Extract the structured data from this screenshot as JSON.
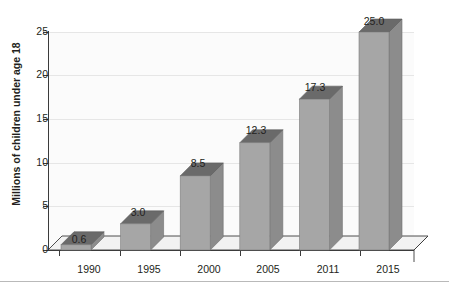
{
  "chart_data": {
    "type": "bar",
    "title": "",
    "title_clipped_note": "",
    "categories": [
      "1990",
      "1995",
      "2000",
      "2005",
      "2011",
      "2015"
    ],
    "values": [
      0.6,
      3.0,
      8.5,
      12.3,
      17.3,
      25.0
    ],
    "data_labels": [
      "0.6",
      "3.0",
      "8.5",
      "12.3",
      "17.3",
      "25.0"
    ],
    "xlabel": "",
    "ylabel": "Millions of children under age 18",
    "ylim": [
      0,
      25
    ],
    "ytick_labels": [
      "0",
      "5",
      "10",
      "15",
      "20",
      "25"
    ],
    "ytick_values": [
      0,
      5,
      10,
      15,
      20,
      25
    ],
    "grid": true,
    "grid_axis": "y",
    "legend": false,
    "style": "3d-column",
    "colors": {
      "bar_front": "#a6a6a6",
      "bar_top": "#6a6a6a",
      "bar_side": "#8c8c8c",
      "axis": "#3b3b3b",
      "grid": "#e6e6e6",
      "floor": "#fbfbfb",
      "text": "#231f20"
    }
  }
}
